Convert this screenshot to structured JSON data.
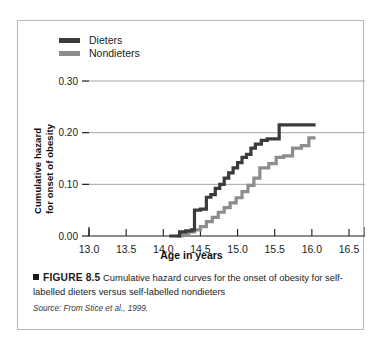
{
  "legend": {
    "position": "top-left inside plot",
    "entries": [
      {
        "label": "Dieters",
        "color": "#3b3b3b",
        "swatch_name": "legend-swatch-dieters"
      },
      {
        "label": "Nondieters",
        "color": "#8d8d8d",
        "swatch_name": "legend-swatch-nondieters"
      }
    ]
  },
  "axes": {
    "y_title_line1": "Cumulative hazard",
    "y_title_line2": "for onset of obesity",
    "x_title": "Age in years"
  },
  "caption": {
    "figure_label": "FIGURE 8.5",
    "text": "Cumulative hazard curves for the onset of obesity for self-labelled dieters versus self-labelled nondieters",
    "source": "Source: From Stice et al., 1999."
  },
  "chart_data": {
    "type": "line",
    "subtype": "step",
    "title": "Cumulative hazard curves for the onset of obesity",
    "xlabel": "Age in years",
    "ylabel": "Cumulative hazard for onset of obesity",
    "xlim": [
      13.0,
      16.5
    ],
    "ylim": [
      0.0,
      0.3
    ],
    "xticks": [
      13.0,
      13.5,
      14.0,
      14.5,
      15.0,
      15.5,
      16.0,
      16.5
    ],
    "xtick_labels": [
      "13.0",
      "13.5",
      "14.0",
      "14.5",
      "15.0",
      "15.5",
      "16.0",
      "16.5"
    ],
    "yticks": [
      0.0,
      0.1,
      0.2,
      0.3
    ],
    "ytick_labels": [
      "0.00",
      "0.10",
      "0.20",
      "0.30"
    ],
    "grid": "horizontal gridlines at 0.10, 0.20, 0.30",
    "legend_position": "upper left",
    "series": [
      {
        "name": "Dieters",
        "color": "#3b3b3b",
        "x": [
          14.08,
          14.18,
          14.22,
          14.3,
          14.38,
          14.42,
          14.5,
          14.58,
          14.64,
          14.7,
          14.76,
          14.82,
          14.88,
          14.94,
          15.0,
          15.06,
          15.12,
          15.18,
          15.24,
          15.32,
          15.4,
          15.56,
          16.05
        ],
        "y": [
          0.0,
          0.0,
          0.008,
          0.01,
          0.012,
          0.05,
          0.052,
          0.075,
          0.08,
          0.092,
          0.1,
          0.112,
          0.122,
          0.132,
          0.142,
          0.152,
          0.158,
          0.17,
          0.178,
          0.185,
          0.188,
          0.215,
          0.215
        ]
      },
      {
        "name": "Nondieters",
        "color": "#8d8d8d",
        "x": [
          14.18,
          14.26,
          14.34,
          14.42,
          14.5,
          14.58,
          14.66,
          14.74,
          14.82,
          14.9,
          14.98,
          15.06,
          15.14,
          15.22,
          15.3,
          15.42,
          15.52,
          15.62,
          15.74,
          15.86,
          15.96,
          16.05
        ],
        "y": [
          0.0,
          0.004,
          0.008,
          0.012,
          0.018,
          0.028,
          0.036,
          0.046,
          0.055,
          0.064,
          0.074,
          0.086,
          0.098,
          0.112,
          0.132,
          0.14,
          0.152,
          0.155,
          0.17,
          0.175,
          0.19,
          0.19
        ]
      }
    ],
    "annotations": [
      "Dieters curve rises earlier and stays above the nondieters curve across ages 14.4-16.0",
      "Dieters final cumulative hazard approximately 0.215",
      "Nondieters final cumulative hazard approximately 0.19"
    ]
  }
}
